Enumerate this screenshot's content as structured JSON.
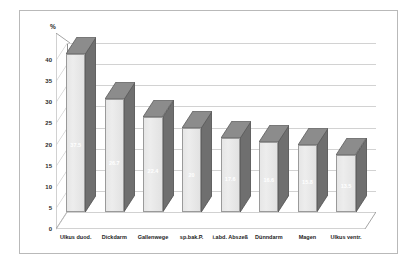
{
  "chart": {
    "y_unit_label": "%",
    "annotation": "n = 427 ; Letalität gesamt = 19.7 %"
  },
  "chart_data": {
    "type": "bar",
    "title": "",
    "subtitle": "",
    "xlabel": "",
    "ylabel": "%",
    "ylim": [
      0,
      40
    ],
    "yticks": [
      0,
      5,
      10,
      15,
      20,
      25,
      30,
      35,
      40
    ],
    "ytick_labels": [
      "0",
      "5",
      "10",
      "15",
      "20",
      "25",
      "30",
      "35",
      "40"
    ],
    "grid": true,
    "legend": false,
    "style": "3d-column",
    "annotations": [
      "n = 427 ; Letalität gesamt = 19.7 %"
    ],
    "categories": [
      "Ulkus duod.",
      "Dickdarm",
      "Gallenwege",
      "sp.bak.P.",
      "i.abd. Abszeß",
      "Dünndarm",
      "Magen",
      "Ulkus ventr."
    ],
    "values": [
      37.5,
      26.7,
      22.4,
      20.0,
      17.6,
      16.6,
      15.8,
      13.5
    ],
    "value_labels": [
      "37.5",
      "26.7",
      "22.4",
      "20",
      "17.6",
      "16.6",
      "15.8",
      "13.5"
    ],
    "colors": {
      "bar_face": "#e8e8e8",
      "bar_side": "#6f6f6f",
      "bar_top": "#8c8c8c",
      "gridline": "#d2d2d2",
      "axis": "#8d8d8d",
      "frame_border": "#b9b9b9",
      "background": "#ffffff",
      "text": "#1d1d1d",
      "value_label": "#ffffff"
    }
  }
}
